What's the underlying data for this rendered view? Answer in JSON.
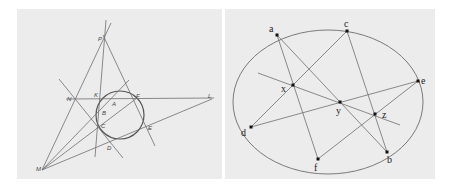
{
  "figure_left": {
    "title": "Brianchon / Pascal construction with circle",
    "circle": {
      "cx": 120,
      "cy": 115,
      "r": 24
    },
    "labels": [
      {
        "id": "P",
        "text": "P",
        "x": 98,
        "y": 41
      },
      {
        "id": "N",
        "text": "N",
        "x": 67,
        "y": 101
      },
      {
        "id": "K",
        "text": "K",
        "x": 94,
        "y": 97
      },
      {
        "id": "A",
        "text": "A",
        "x": 112,
        "y": 106
      },
      {
        "id": "F",
        "text": "F",
        "x": 136,
        "y": 98
      },
      {
        "id": "L",
        "text": "L",
        "x": 208,
        "y": 98
      },
      {
        "id": "B",
        "text": "B",
        "x": 102,
        "y": 115
      },
      {
        "id": "C",
        "text": "C",
        "x": 101,
        "y": 128
      },
      {
        "id": "E",
        "text": "E",
        "x": 148,
        "y": 130
      },
      {
        "id": "D",
        "text": "D",
        "x": 107,
        "y": 150
      },
      {
        "id": "M",
        "text": "M",
        "x": 36,
        "y": 171
      }
    ]
  },
  "figure_right": {
    "title": "Pascal's theorem on ellipse",
    "ellipse": {
      "cx": 328,
      "cy": 102,
      "rx": 95,
      "ry": 72
    },
    "points": [
      {
        "id": "a",
        "text": "a",
        "x": 277,
        "y": 35,
        "lx": 269,
        "ly": 32
      },
      {
        "id": "c",
        "text": "c",
        "x": 347,
        "y": 31,
        "lx": 344,
        "ly": 27
      },
      {
        "id": "e",
        "text": "e",
        "x": 418,
        "y": 81,
        "lx": 421,
        "ly": 84
      },
      {
        "id": "b",
        "text": "b",
        "x": 387,
        "y": 152,
        "lx": 387,
        "ly": 163
      },
      {
        "id": "f",
        "text": "f",
        "x": 318,
        "y": 159,
        "lx": 314,
        "ly": 171
      },
      {
        "id": "d",
        "text": "d",
        "x": 251,
        "y": 127,
        "lx": 241,
        "ly": 136
      },
      {
        "id": "x",
        "text": "x",
        "x": 293,
        "y": 85,
        "lx": 281,
        "ly": 92
      },
      {
        "id": "y",
        "text": "y",
        "x": 340,
        "y": 102,
        "lx": 336,
        "ly": 114
      },
      {
        "id": "z",
        "text": "z",
        "x": 375,
        "y": 114,
        "lx": 382,
        "ly": 118
      }
    ]
  }
}
